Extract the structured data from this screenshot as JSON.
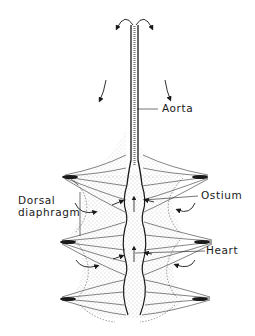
{
  "figure": {
    "labels": {
      "aorta": "Aorta",
      "dorsal_line1": "Dorsal",
      "dorsal_line2": "diaphragm",
      "ostium": "Ostium",
      "heart": "Heart"
    },
    "colors": {
      "ink": "#1a1a1a",
      "stipple": "#888888",
      "background": "#ffffff"
    }
  }
}
